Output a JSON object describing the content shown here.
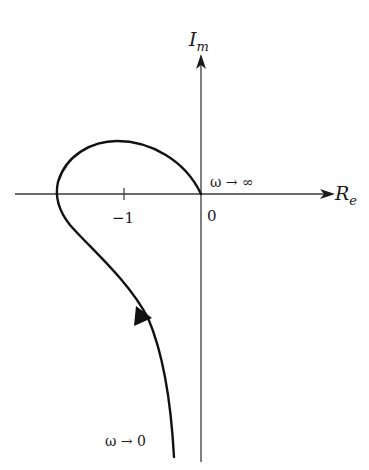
{
  "diagram": {
    "type": "nyquist-plot",
    "axes": {
      "real_label": "R",
      "real_subscript": "e",
      "imag_label": "I",
      "imag_subscript": "m"
    },
    "ticks": {
      "minus_one": "−1",
      "origin": "0"
    },
    "annotations": {
      "omega_infinity": "ω → ∞",
      "omega_zero": "ω → 0"
    },
    "colors": {
      "axis": "#3a3a3a",
      "curve": "#111111",
      "text": "#1a1a1a"
    }
  }
}
